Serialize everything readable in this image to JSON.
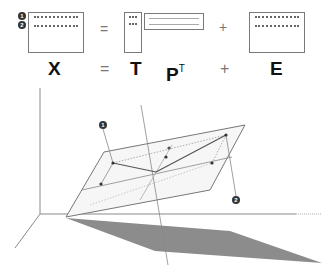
{
  "equation": {
    "row_markers": [
      "1",
      "2"
    ],
    "matrix_x_label": "X",
    "equals_symbol": "=",
    "matrix_t_label": "T",
    "matrix_p_label": "P",
    "matrix_p_superscript": "T",
    "plus_symbol": "+",
    "matrix_e_label": "E"
  },
  "diagram": {
    "markers": [
      "1",
      "2"
    ],
    "colors": {
      "axis": "#8a8a8a",
      "plane_fill": "#f4f4f4",
      "plane_edge": "#7a7a7a",
      "shadow": "#8c8c8c",
      "points": "#333333"
    }
  }
}
